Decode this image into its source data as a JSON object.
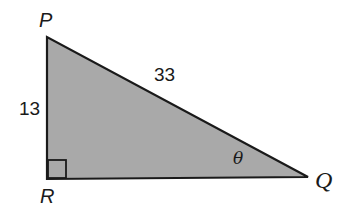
{
  "diagram": {
    "type": "right-triangle",
    "fill_color": "#a9a9a9",
    "stroke_color": "#1a1a1a",
    "vertices": {
      "P": {
        "label": "P",
        "x": 47,
        "y": 37
      },
      "R": {
        "label": "R",
        "x": 47,
        "y": 179
      },
      "Q": {
        "label": "Q",
        "x": 308,
        "y": 177
      }
    },
    "sides": {
      "PQ": {
        "label": "33",
        "role": "hypotenuse"
      },
      "PR": {
        "label": "13",
        "role": "leg"
      }
    },
    "right_angle_at": "R",
    "angle": {
      "vertex": "Q",
      "label": "θ"
    }
  }
}
